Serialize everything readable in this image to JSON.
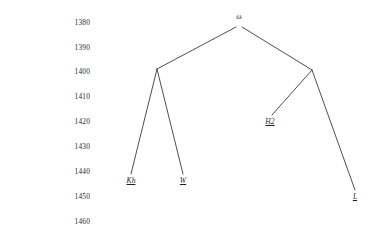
{
  "figure": {
    "kind": "stemma-tree",
    "background_color": "#ffffff",
    "line_color": "#3a3a3a",
    "text_color": "#1f1f1f"
  },
  "axis": {
    "name": "year-axis",
    "orientation": "vertical",
    "min": 1380,
    "max": 1460,
    "step": 10,
    "ticks": [
      {
        "label": "1380",
        "value": 1380,
        "y": 22
      },
      {
        "label": "1390",
        "value": 1390,
        "y": 47
      },
      {
        "label": "1400",
        "value": 1400,
        "y": 71
      },
      {
        "label": "1410",
        "value": 1410,
        "y": 96
      },
      {
        "label": "1420",
        "value": 1420,
        "y": 121
      },
      {
        "label": "1430",
        "value": 1430,
        "y": 146
      },
      {
        "label": "1440",
        "value": 1440,
        "y": 171
      },
      {
        "label": "1450",
        "value": 1450,
        "y": 196
      },
      {
        "label": "1460",
        "value": 1460,
        "y": 221
      }
    ]
  },
  "chart_data": {
    "type": "tree",
    "title": "",
    "xlabel": "",
    "ylabel": "",
    "ylim": [
      1380,
      1460
    ],
    "grid": false,
    "legend": "none",
    "nodes": [
      {
        "id": "root",
        "label": "ω",
        "kind": "root",
        "year": 1382,
        "x": 239,
        "y": 24,
        "underline": false,
        "italic": false
      },
      {
        "id": "alpha",
        "label": "",
        "kind": "internal",
        "year": 1402,
        "x": 157,
        "y": 69,
        "underline": false,
        "italic": false
      },
      {
        "id": "beta",
        "label": "",
        "kind": "internal",
        "year": 1402,
        "x": 312,
        "y": 70,
        "underline": false,
        "italic": false
      },
      {
        "id": "kh",
        "label": "Kh",
        "kind": "leaf",
        "year": 1443,
        "x": 131,
        "y": 181,
        "underline": true,
        "italic": true
      },
      {
        "id": "w",
        "label": "W",
        "kind": "leaf",
        "year": 1443,
        "x": 183,
        "y": 181,
        "underline": true,
        "italic": true
      },
      {
        "id": "h2",
        "label": "H2",
        "kind": "leaf",
        "year": 1421,
        "x": 270,
        "y": 122,
        "underline": true,
        "italic": true
      },
      {
        "id": "l",
        "label": "L",
        "kind": "leaf",
        "year": 1452,
        "x": 355,
        "y": 197,
        "underline": true,
        "italic": true
      }
    ],
    "edges": [
      {
        "from": "root",
        "to": "alpha",
        "x1": 236,
        "y1": 27,
        "x2": 157,
        "y2": 69
      },
      {
        "from": "root",
        "to": "beta",
        "x1": 242,
        "y1": 27,
        "x2": 312,
        "y2": 70
      },
      {
        "from": "alpha",
        "to": "kh",
        "x1": 157,
        "y1": 69,
        "x2": 131,
        "y2": 174
      },
      {
        "from": "alpha",
        "to": "w",
        "x1": 157,
        "y1": 69,
        "x2": 183,
        "y2": 174
      },
      {
        "from": "beta",
        "to": "h2",
        "x1": 312,
        "y1": 70,
        "x2": 272,
        "y2": 115
      },
      {
        "from": "beta",
        "to": "l",
        "x1": 312,
        "y1": 70,
        "x2": 355,
        "y2": 190
      }
    ]
  }
}
